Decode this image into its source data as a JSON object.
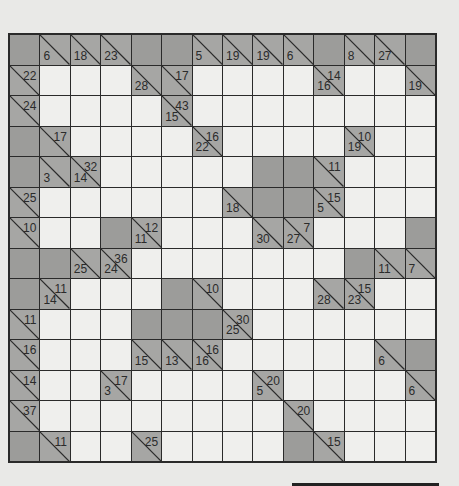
{
  "puzzle": {
    "type": "Kakuro",
    "rows": 14,
    "cols": 14,
    "colors": {
      "white_cell": "#efefed",
      "clue_cell": "#a6a6a4",
      "block_cell": "#9c9c9a",
      "grid_line": "#2a2a2a"
    },
    "grid": [
      [
        {
          "t": "X"
        },
        {
          "t": "C",
          "d": "6"
        },
        {
          "t": "C",
          "d": "18"
        },
        {
          "t": "C",
          "d": "23"
        },
        {
          "t": "X"
        },
        {
          "t": "X"
        },
        {
          "t": "C",
          "d": "5"
        },
        {
          "t": "C",
          "d": "19"
        },
        {
          "t": "C",
          "d": "19"
        },
        {
          "t": "C",
          "d": "6"
        },
        {
          "t": "X"
        },
        {
          "t": "C",
          "d": "8"
        },
        {
          "t": "C",
          "d": "27"
        },
        {
          "t": "X"
        }
      ],
      [
        {
          "t": "C",
          "r": "22"
        },
        {
          "t": "W"
        },
        {
          "t": "W"
        },
        {
          "t": "W"
        },
        {
          "t": "C",
          "d": "28"
        },
        {
          "t": "C",
          "r": "17"
        },
        {
          "t": "W"
        },
        {
          "t": "W"
        },
        {
          "t": "W"
        },
        {
          "t": "W"
        },
        {
          "t": "C",
          "r": "14",
          "d": "16"
        },
        {
          "t": "W"
        },
        {
          "t": "W"
        },
        {
          "t": "C",
          "d": "19"
        }
      ],
      [
        {
          "t": "C",
          "r": "24"
        },
        {
          "t": "W"
        },
        {
          "t": "W"
        },
        {
          "t": "W"
        },
        {
          "t": "W"
        },
        {
          "t": "C",
          "r": "43",
          "d": "15"
        },
        {
          "t": "W"
        },
        {
          "t": "W"
        },
        {
          "t": "W"
        },
        {
          "t": "W"
        },
        {
          "t": "W"
        },
        {
          "t": "W"
        },
        {
          "t": "W"
        },
        {
          "t": "W"
        }
      ],
      [
        {
          "t": "X"
        },
        {
          "t": "C",
          "r": "17"
        },
        {
          "t": "W"
        },
        {
          "t": "W"
        },
        {
          "t": "W"
        },
        {
          "t": "W"
        },
        {
          "t": "C",
          "r": "16",
          "d": "22"
        },
        {
          "t": "W"
        },
        {
          "t": "W"
        },
        {
          "t": "W"
        },
        {
          "t": "W"
        },
        {
          "t": "C",
          "r": "10",
          "d": "19"
        },
        {
          "t": "W"
        },
        {
          "t": "W"
        }
      ],
      [
        {
          "t": "X"
        },
        {
          "t": "C",
          "d": "3"
        },
        {
          "t": "C",
          "r": "32",
          "d": "14"
        },
        {
          "t": "W"
        },
        {
          "t": "W"
        },
        {
          "t": "W"
        },
        {
          "t": "W"
        },
        {
          "t": "W"
        },
        {
          "t": "X"
        },
        {
          "t": "X"
        },
        {
          "t": "C",
          "r": "11"
        },
        {
          "t": "W"
        },
        {
          "t": "W"
        },
        {
          "t": "W"
        }
      ],
      [
        {
          "t": "C",
          "r": "25"
        },
        {
          "t": "W"
        },
        {
          "t": "W"
        },
        {
          "t": "W"
        },
        {
          "t": "W"
        },
        {
          "t": "W"
        },
        {
          "t": "W"
        },
        {
          "t": "C",
          "d": "18"
        },
        {
          "t": "X"
        },
        {
          "t": "X"
        },
        {
          "t": "C",
          "r": "15",
          "d": "5"
        },
        {
          "t": "W"
        },
        {
          "t": "W"
        },
        {
          "t": "W"
        }
      ],
      [
        {
          "t": "C",
          "r": "10"
        },
        {
          "t": "W"
        },
        {
          "t": "W"
        },
        {
          "t": "X"
        },
        {
          "t": "C",
          "r": "12",
          "d": "11"
        },
        {
          "t": "W"
        },
        {
          "t": "W"
        },
        {
          "t": "W"
        },
        {
          "t": "C",
          "d": "30"
        },
        {
          "t": "C",
          "r": "7",
          "d": "27"
        },
        {
          "t": "W"
        },
        {
          "t": "W"
        },
        {
          "t": "W"
        },
        {
          "t": "X"
        }
      ],
      [
        {
          "t": "X"
        },
        {
          "t": "X"
        },
        {
          "t": "C",
          "d": "25"
        },
        {
          "t": "C",
          "r": "36",
          "d": "24"
        },
        {
          "t": "W"
        },
        {
          "t": "W"
        },
        {
          "t": "W"
        },
        {
          "t": "W"
        },
        {
          "t": "W"
        },
        {
          "t": "W"
        },
        {
          "t": "W"
        },
        {
          "t": "X"
        },
        {
          "t": "C",
          "d": "11"
        },
        {
          "t": "C",
          "d": "7"
        }
      ],
      [
        {
          "t": "X"
        },
        {
          "t": "C",
          "r": "11",
          "d": "14"
        },
        {
          "t": "W"
        },
        {
          "t": "W"
        },
        {
          "t": "W"
        },
        {
          "t": "X"
        },
        {
          "t": "C",
          "r": "10"
        },
        {
          "t": "W"
        },
        {
          "t": "W"
        },
        {
          "t": "W"
        },
        {
          "t": "C",
          "d": "28"
        },
        {
          "t": "C",
          "r": "15",
          "d": "23"
        },
        {
          "t": "W"
        },
        {
          "t": "W"
        }
      ],
      [
        {
          "t": "C",
          "r": "11"
        },
        {
          "t": "W"
        },
        {
          "t": "W"
        },
        {
          "t": "W"
        },
        {
          "t": "X"
        },
        {
          "t": "X"
        },
        {
          "t": "X"
        },
        {
          "t": "C",
          "r": "30",
          "d": "25"
        },
        {
          "t": "W"
        },
        {
          "t": "W"
        },
        {
          "t": "W"
        },
        {
          "t": "W"
        },
        {
          "t": "W"
        },
        {
          "t": "W"
        }
      ],
      [
        {
          "t": "C",
          "r": "16"
        },
        {
          "t": "W"
        },
        {
          "t": "W"
        },
        {
          "t": "W"
        },
        {
          "t": "C",
          "d": "15"
        },
        {
          "t": "C",
          "d": "13"
        },
        {
          "t": "C",
          "r": "16",
          "d": "16"
        },
        {
          "t": "W"
        },
        {
          "t": "W"
        },
        {
          "t": "W"
        },
        {
          "t": "W"
        },
        {
          "t": "W"
        },
        {
          "t": "C",
          "d": "6"
        },
        {
          "t": "X"
        }
      ],
      [
        {
          "t": "C",
          "r": "14"
        },
        {
          "t": "W"
        },
        {
          "t": "W"
        },
        {
          "t": "C",
          "r": "17",
          "d": "3"
        },
        {
          "t": "W"
        },
        {
          "t": "W"
        },
        {
          "t": "W"
        },
        {
          "t": "W"
        },
        {
          "t": "C",
          "r": "20",
          "d": "5"
        },
        {
          "t": "W"
        },
        {
          "t": "W"
        },
        {
          "t": "W"
        },
        {
          "t": "W"
        },
        {
          "t": "C",
          "d": "6"
        }
      ],
      [
        {
          "t": "C",
          "r": "37"
        },
        {
          "t": "W"
        },
        {
          "t": "W"
        },
        {
          "t": "W"
        },
        {
          "t": "W"
        },
        {
          "t": "W"
        },
        {
          "t": "W"
        },
        {
          "t": "W"
        },
        {
          "t": "W"
        },
        {
          "t": "C",
          "r": "20"
        },
        {
          "t": "W"
        },
        {
          "t": "W"
        },
        {
          "t": "W"
        },
        {
          "t": "W"
        }
      ],
      [
        {
          "t": "X"
        },
        {
          "t": "C",
          "r": "11"
        },
        {
          "t": "W"
        },
        {
          "t": "W"
        },
        {
          "t": "C",
          "r": "25"
        },
        {
          "t": "W"
        },
        {
          "t": "W"
        },
        {
          "t": "W"
        },
        {
          "t": "W"
        },
        {
          "t": "X"
        },
        {
          "t": "C",
          "r": "15"
        },
        {
          "t": "W"
        },
        {
          "t": "W"
        },
        {
          "t": "W"
        }
      ]
    ]
  }
}
